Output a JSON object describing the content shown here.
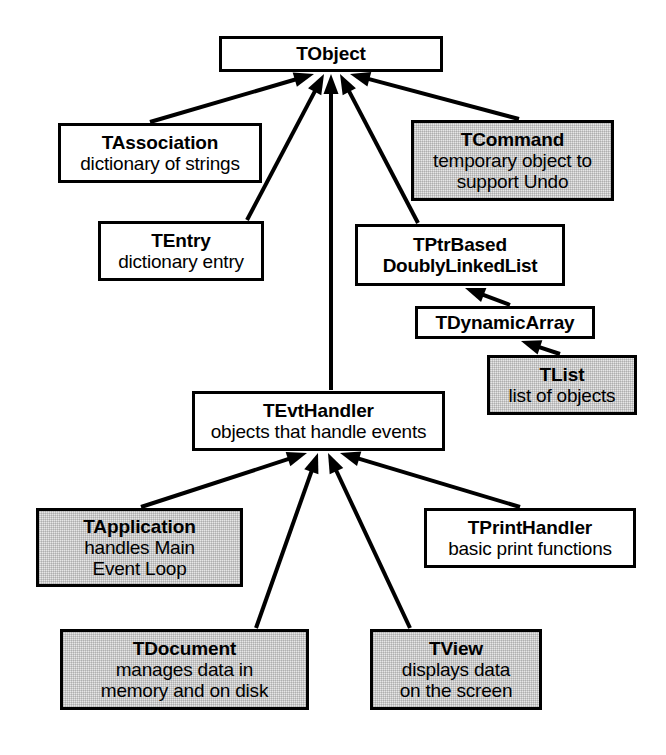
{
  "diagram": {
    "kind": "inheritance-class-diagram",
    "arrow_meaning": "arrow points from subclass up to its base class",
    "colors": {
      "line": "#000000",
      "box_fill_plain": "#ffffff",
      "box_fill_shaded": "#e6e6e6",
      "text": "#000000"
    },
    "nodes": [
      {
        "id": "tobject",
        "name": "TObject",
        "desc": "",
        "shaded": false,
        "x": 219,
        "y": 36,
        "w": 224,
        "h": 36
      },
      {
        "id": "tassociation",
        "name": "TAssociation",
        "desc": "dictionary of strings",
        "shaded": false,
        "x": 58,
        "y": 123,
        "w": 204,
        "h": 60
      },
      {
        "id": "tcommand",
        "name": "TCommand",
        "desc": "temporary object to\nsupport Undo",
        "shaded": true,
        "x": 411,
        "y": 120,
        "w": 203,
        "h": 81
      },
      {
        "id": "tentry",
        "name": "TEntry",
        "desc": "dictionary entry",
        "shaded": false,
        "x": 98,
        "y": 221,
        "w": 166,
        "h": 60
      },
      {
        "id": "tptrbased",
        "name": "TPtrBased",
        "name2": "DoublyLinkedList",
        "desc": "",
        "shaded": false,
        "x": 355,
        "y": 224,
        "w": 210,
        "h": 62
      },
      {
        "id": "tdynamicarray",
        "name": "TDynamicArray",
        "desc": "",
        "shaded": false,
        "x": 415,
        "y": 306,
        "w": 180,
        "h": 33
      },
      {
        "id": "tlist",
        "name": "TList",
        "desc": "list of objects",
        "shaded": true,
        "x": 487,
        "y": 355,
        "w": 150,
        "h": 60
      },
      {
        "id": "tevthandler",
        "name": "TEvtHandler",
        "desc": "objects that handle events",
        "shaded": false,
        "x": 192,
        "y": 391,
        "w": 253,
        "h": 60
      },
      {
        "id": "tapplication",
        "name": "TApplication",
        "desc": "handles Main\nEvent Loop",
        "shaded": true,
        "x": 36,
        "y": 508,
        "w": 207,
        "h": 79
      },
      {
        "id": "tprinthandler",
        "name": "TPrintHandler",
        "desc": "basic print functions",
        "shaded": false,
        "x": 424,
        "y": 508,
        "w": 212,
        "h": 60
      },
      {
        "id": "tdocument",
        "name": "TDocument",
        "desc": "manages data in\nmemory and on disk",
        "shaded": true,
        "x": 60,
        "y": 629,
        "w": 249,
        "h": 81
      },
      {
        "id": "tview",
        "name": "TView",
        "desc": "displays data\non the screen",
        "shaded": true,
        "x": 370,
        "y": 629,
        "w": 172,
        "h": 81
      }
    ],
    "edges": [
      {
        "id": "e-tassociation-tobject",
        "from": "tassociation",
        "to": "tobject",
        "x1": 150,
        "y1": 122,
        "x2": 314,
        "y2": 74,
        "head": "up"
      },
      {
        "id": "e-tentry-tobject",
        "from": "tentry",
        "to": "tobject",
        "x1": 247,
        "y1": 220,
        "x2": 324,
        "y2": 74,
        "head": "up"
      },
      {
        "id": "e-tevthandler-tobject",
        "from": "tevthandler",
        "to": "tobject",
        "x1": 331,
        "y1": 390,
        "x2": 331,
        "y2": 74,
        "head": "up"
      },
      {
        "id": "e-tptrbased-tobject",
        "from": "tptrbased",
        "to": "tobject",
        "x1": 418,
        "y1": 223,
        "x2": 340,
        "y2": 74,
        "head": "up"
      },
      {
        "id": "e-tcommand-tobject",
        "from": "tcommand",
        "to": "tobject",
        "x1": 519,
        "y1": 119,
        "x2": 350,
        "y2": 74,
        "head": "up"
      },
      {
        "id": "e-tdynamicarray-tptrbased",
        "from": "tdynamicarray",
        "to": "tptrbased",
        "x1": 510,
        "y1": 305,
        "x2": 465,
        "y2": 288,
        "head": "up"
      },
      {
        "id": "e-tlist-tdynamicarray",
        "from": "tlist",
        "to": "tdynamicarray",
        "x1": 560,
        "y1": 354,
        "x2": 521,
        "y2": 341,
        "head": "up"
      },
      {
        "id": "e-tapplication-tevthandler",
        "from": "tapplication",
        "to": "tevthandler",
        "x1": 141,
        "y1": 507,
        "x2": 307,
        "y2": 453,
        "head": "up"
      },
      {
        "id": "e-tdocument-tevthandler",
        "from": "tdocument",
        "to": "tevthandler",
        "x1": 256,
        "y1": 628,
        "x2": 318,
        "y2": 453,
        "head": "up"
      },
      {
        "id": "e-tview-tevthandler",
        "from": "tview",
        "to": "tevthandler",
        "x1": 410,
        "y1": 628,
        "x2": 328,
        "y2": 453,
        "head": "up"
      },
      {
        "id": "e-tprinthandler-tevthandler",
        "from": "tprinthandler",
        "to": "tevthandler",
        "x1": 520,
        "y1": 507,
        "x2": 340,
        "y2": 453,
        "head": "up"
      }
    ]
  }
}
